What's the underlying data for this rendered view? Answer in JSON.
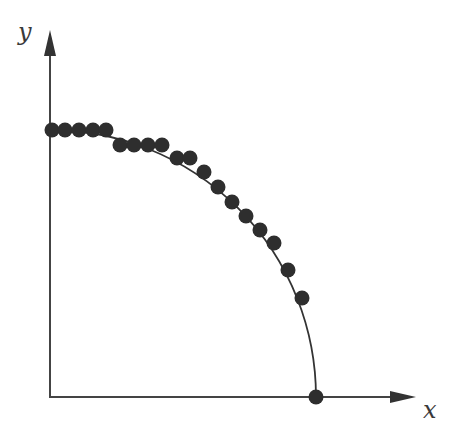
{
  "figure": {
    "x_axis_label": "x",
    "y_axis_label": "y",
    "colors": {
      "axis": "#444444",
      "curve": "#333333",
      "points": "#2e2e2e",
      "background": "#ffffff"
    }
  },
  "chart_data": {
    "type": "scatter",
    "title": "",
    "xlabel": "x",
    "ylabel": "y",
    "grid": false,
    "legend": "none",
    "curve": {
      "shape": "quarter-ellipse",
      "from": [
        0,
        1.0
      ],
      "to": [
        1.0,
        0
      ]
    },
    "points": [
      {
        "x": 0.01,
        "y": 1.0
      },
      {
        "x": 0.06,
        "y": 1.0
      },
      {
        "x": 0.11,
        "y": 1.0
      },
      {
        "x": 0.16,
        "y": 1.0
      },
      {
        "x": 0.21,
        "y": 1.0
      },
      {
        "x": 0.26,
        "y": 0.94
      },
      {
        "x": 0.32,
        "y": 0.94
      },
      {
        "x": 0.37,
        "y": 0.94
      },
      {
        "x": 0.42,
        "y": 0.94
      },
      {
        "x": 0.48,
        "y": 0.89
      },
      {
        "x": 0.53,
        "y": 0.89
      },
      {
        "x": 0.58,
        "y": 0.84
      },
      {
        "x": 0.63,
        "y": 0.78
      },
      {
        "x": 0.68,
        "y": 0.73
      },
      {
        "x": 0.74,
        "y": 0.68
      },
      {
        "x": 0.79,
        "y": 0.63
      },
      {
        "x": 0.84,
        "y": 0.58
      },
      {
        "x": 0.89,
        "y": 0.48
      },
      {
        "x": 0.95,
        "y": 0.37
      },
      {
        "x": 1.0,
        "y": 0.0
      }
    ],
    "pixel_points": [
      [
        52,
        130
      ],
      [
        65,
        130
      ],
      [
        79,
        130
      ],
      [
        93,
        130
      ],
      [
        106,
        130
      ],
      [
        120,
        145
      ],
      [
        134,
        145
      ],
      [
        148,
        145
      ],
      [
        162,
        145
      ],
      [
        177,
        158
      ],
      [
        190,
        158
      ],
      [
        204,
        172
      ],
      [
        218,
        187
      ],
      [
        232,
        202
      ],
      [
        246,
        216
      ],
      [
        260,
        230
      ],
      [
        274,
        243
      ],
      [
        288,
        270
      ],
      [
        302,
        298
      ],
      [
        316,
        397
      ]
    ]
  }
}
